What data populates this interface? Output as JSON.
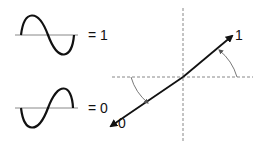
{
  "waves": [
    {
      "label": "= 1",
      "phase": "positive-first"
    },
    {
      "label": "= 0",
      "phase": "negative-first"
    }
  ],
  "vector": {
    "end_labels": {
      "positive": "1",
      "negative": "0"
    }
  },
  "colors": {
    "stroke": "#111111",
    "axis": "#888888",
    "background": "#ffffff"
  }
}
